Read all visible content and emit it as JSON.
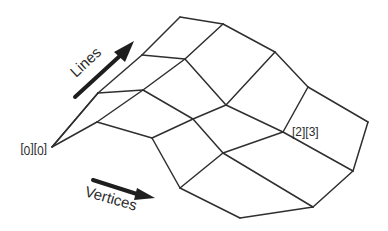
{
  "diagram": {
    "type": "mesh-grid",
    "grid": {
      "lines": 4,
      "vertices_per_line": 5
    },
    "axis_labels": {
      "lines": "Lines",
      "vertices": "Vertices"
    },
    "index_labels": {
      "origin": "[0][0]",
      "sample": "[2][3]"
    },
    "colors": {
      "edge": "#2f2f2f",
      "arrow": "#1e1e1e",
      "text": "#2a2a2a",
      "background": "#ffffff"
    }
  }
}
